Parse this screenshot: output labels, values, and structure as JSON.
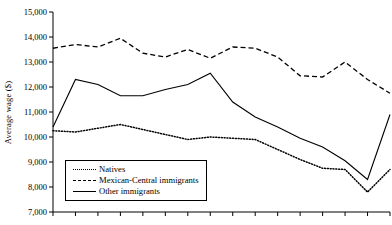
{
  "chart_data": {
    "type": "line",
    "title": "",
    "xlabel": "",
    "ylabel": "Average wage ($)",
    "ylim": [
      7000,
      15000
    ],
    "yticks": [
      "7,000",
      "8,000",
      "9,000",
      "10,000",
      "11,000",
      "12,000",
      "13,000",
      "14,000",
      "15,000"
    ],
    "ytick_values": [
      7000,
      8000,
      9000,
      10000,
      11000,
      12000,
      13000,
      14000,
      15000
    ],
    "xticks": [],
    "x": [
      1,
      2,
      3,
      4,
      5,
      6,
      7,
      8,
      9,
      10,
      11,
      12,
      13,
      14,
      15,
      16
    ],
    "grid": false,
    "legend_position": "lower-left",
    "series": [
      {
        "name": "Natives",
        "style": "dotted",
        "color": "#000000",
        "values": [
          10250,
          10200,
          10350,
          10500,
          10300,
          10100,
          9900,
          10000,
          9950,
          9900,
          9500,
          9100,
          8750,
          8700,
          7800,
          8700
        ]
      },
      {
        "name": "Mexican-Central immigrants",
        "style": "dashed",
        "color": "#000000",
        "values": [
          13550,
          13700,
          13600,
          13950,
          13350,
          13200,
          13500,
          13150,
          13600,
          13550,
          13200,
          12450,
          12400,
          13000,
          12300,
          11750
        ]
      },
      {
        "name": "Other immigrants",
        "style": "solid",
        "color": "#000000",
        "values": [
          10400,
          12300,
          12100,
          11650,
          11650,
          11900,
          12100,
          12550,
          11400,
          10800,
          10400,
          9950,
          9600,
          9050,
          8300,
          10900
        ]
      }
    ]
  },
  "legend": {
    "items": [
      {
        "label": "Natives",
        "style": "dotted"
      },
      {
        "label": "Mexican-Central immigrants",
        "style": "dashed"
      },
      {
        "label": "Other immigrants",
        "style": "solid"
      }
    ]
  }
}
